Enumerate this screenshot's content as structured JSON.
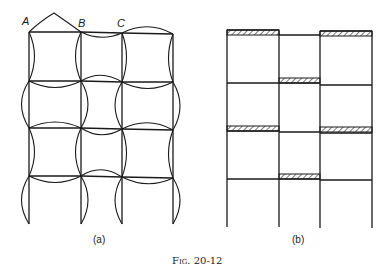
{
  "figure": {
    "caption": "Fig. 20-12",
    "panel_a": {
      "label": "(a)",
      "node_labels": [
        "A",
        "B",
        "C"
      ]
    },
    "panel_b": {
      "label": "(b)"
    }
  }
}
